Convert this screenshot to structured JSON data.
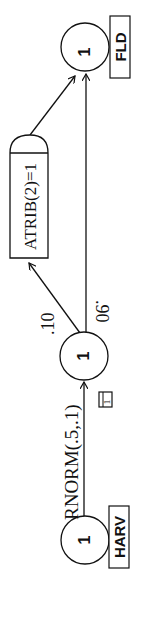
{
  "diagram": {
    "type": "SLAM network",
    "orientation": "rotated-90-ccw",
    "nodes": [
      {
        "id": "harv",
        "value": "1",
        "label": "HARV"
      },
      {
        "id": "mid",
        "value": "1",
        "activity_number": "1"
      },
      {
        "id": "fld",
        "value": "1",
        "label": "FLD"
      }
    ],
    "activities": [
      {
        "from": "harv",
        "to": "mid",
        "duration": "RNORM(.5,.1)",
        "number": "1"
      },
      {
        "from": "mid",
        "to": "assign",
        "probability": ".10"
      },
      {
        "from": "mid",
        "to": "fld",
        "probability": ".90"
      }
    ],
    "assign_node": {
      "label": "ATRIB(2)=1"
    }
  },
  "colors": {
    "line": "#111111",
    "background": "#ffffff"
  }
}
